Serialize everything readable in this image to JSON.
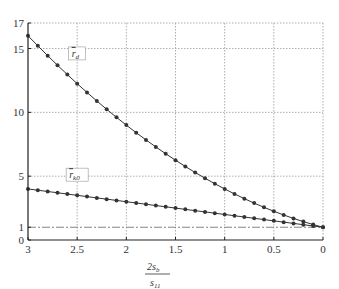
{
  "chart_data": {
    "type": "line",
    "title": "",
    "xlabel": {
      "numerator": "2s",
      "numerator_sub": "b",
      "denominator": "s",
      "denominator_sub": "11"
    },
    "ylabel": "",
    "xlim": [
      3,
      0
    ],
    "ylim": [
      0,
      17
    ],
    "x_reversed": true,
    "grid": true,
    "xticks": [
      3,
      2.5,
      2,
      1.5,
      1,
      0.5,
      0
    ],
    "xtick_labels": [
      "3",
      "2.5",
      "2",
      "1.5",
      "1",
      "0.5",
      "0"
    ],
    "yticks": [
      0,
      1,
      5,
      10,
      15,
      17
    ],
    "ytick_labels": [
      "0",
      "1",
      "5",
      "10",
      "15",
      "17"
    ],
    "reference_line": {
      "y": 1,
      "style": "dash-dot"
    },
    "x": [
      3.0,
      2.9,
      2.8,
      2.7,
      2.6,
      2.5,
      2.4,
      2.3,
      2.2,
      2.1,
      2.0,
      1.9,
      1.8,
      1.7,
      1.6,
      1.5,
      1.4,
      1.3,
      1.2,
      1.1,
      1.0,
      0.9,
      0.8,
      0.7,
      0.6,
      0.5,
      0.4,
      0.3,
      0.2,
      0.1,
      0.0
    ],
    "series": [
      {
        "name": "|r̄d|",
        "label_main": "r",
        "label_sub": "d",
        "label_at": [
          2.5,
          14.5
        ],
        "values": [
          16.0,
          15.21,
          14.44,
          13.69,
          12.96,
          12.25,
          11.56,
          10.89,
          10.24,
          9.61,
          9.0,
          8.41,
          7.84,
          7.29,
          6.76,
          6.25,
          5.76,
          5.29,
          4.84,
          4.41,
          4.0,
          3.61,
          3.24,
          2.89,
          2.56,
          2.25,
          1.96,
          1.69,
          1.44,
          1.21,
          1.0
        ]
      },
      {
        "name": "|r̄k0|",
        "label_main": "r",
        "label_sub": "k0",
        "label_at": [
          2.5,
          5.0
        ],
        "values": [
          4.0,
          3.9,
          3.8,
          3.7,
          3.6,
          3.5,
          3.4,
          3.3,
          3.2,
          3.1,
          3.0,
          2.9,
          2.8,
          2.7,
          2.6,
          2.5,
          2.4,
          2.3,
          2.2,
          2.1,
          2.0,
          1.9,
          1.8,
          1.7,
          1.6,
          1.5,
          1.4,
          1.3,
          1.2,
          1.1,
          1.0
        ]
      }
    ]
  }
}
